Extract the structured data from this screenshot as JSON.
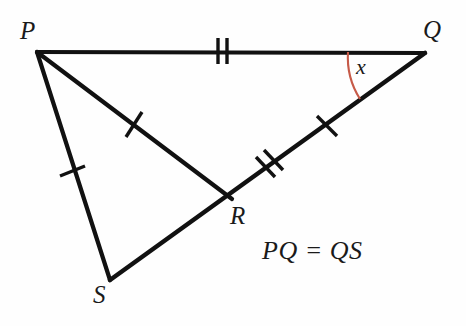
{
  "figure": {
    "kind": "geometry-diagram",
    "background_color": "#fefefe",
    "stroke_color": "#111111",
    "arc_color": "#c65a48",
    "width": 466,
    "height": 326
  },
  "vertices": {
    "P": {
      "label": "P",
      "x": 37,
      "y": 52
    },
    "Q": {
      "label": "Q",
      "x": 425,
      "y": 53
    },
    "R": {
      "label": "R",
      "x": 228,
      "y": 196
    },
    "S": {
      "label": "S",
      "x": 110,
      "y": 280
    }
  },
  "segments": [
    {
      "name": "PQ",
      "from": "P",
      "to": "Q",
      "ticks": 2
    },
    {
      "name": "PS",
      "from": "P",
      "to": "S",
      "ticks": 1
    },
    {
      "name": "PR",
      "from": "P",
      "to": "R",
      "ticks": 1
    },
    {
      "name": "SR",
      "from": "S",
      "to": "R",
      "ticks": 0
    },
    {
      "name": "RQ-lower",
      "from": "R",
      "to": "Q",
      "ticks": 2
    },
    {
      "name": "RQ-upper",
      "from": "R",
      "to": "Q",
      "ticks": 1
    }
  ],
  "angle": {
    "label": "x",
    "at_vertex": "Q",
    "between": [
      "QP",
      "QS"
    ],
    "arc_color": "#c65a48"
  },
  "annotation": {
    "relation": "PQ = QS"
  }
}
